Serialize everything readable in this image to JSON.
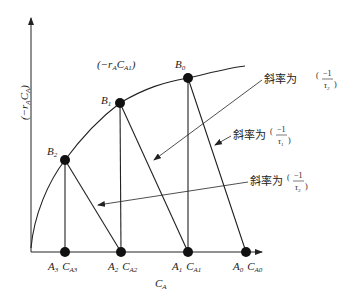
{
  "axes": {
    "y_label_main": "(−r",
    "y_label_sub1": "A",
    "y_label_mid": "C",
    "y_label_sub2": "A",
    "y_label_end": ")",
    "x_label_main": "C",
    "x_label_sub": "A"
  },
  "curve_label": {
    "main": "(−r",
    "sub1": "A",
    "mid": "C",
    "sub2": "A1",
    "end": ")"
  },
  "points": [
    {
      "name": "B",
      "sub": "0"
    },
    {
      "name": "B",
      "sub": "1"
    },
    {
      "name": "B",
      "sub": "2"
    }
  ],
  "baseline_points": [
    {
      "a": "A",
      "a_sub": "3",
      "c": "C",
      "c_sub": "A3"
    },
    {
      "a": "A",
      "a_sub": "2",
      "c": "C",
      "c_sub": "A2"
    },
    {
      "a": "A",
      "a_sub": "1",
      "c": "C",
      "c_sub": "A1"
    },
    {
      "a": "A",
      "a_sub": "0",
      "c": "C",
      "c_sub": "A0"
    }
  ],
  "slope_labels": [
    {
      "text": "斜率为",
      "num": "−1",
      "den": "τ",
      "den_sub": "2"
    },
    {
      "text": "斜率为",
      "num": "−1",
      "den": "τ",
      "den_sub": "1"
    },
    {
      "text": "斜率为",
      "num": "−1",
      "den": "τ",
      "den_sub": "3"
    }
  ],
  "colors": {
    "line": "#222222",
    "background": "#ffffff"
  }
}
